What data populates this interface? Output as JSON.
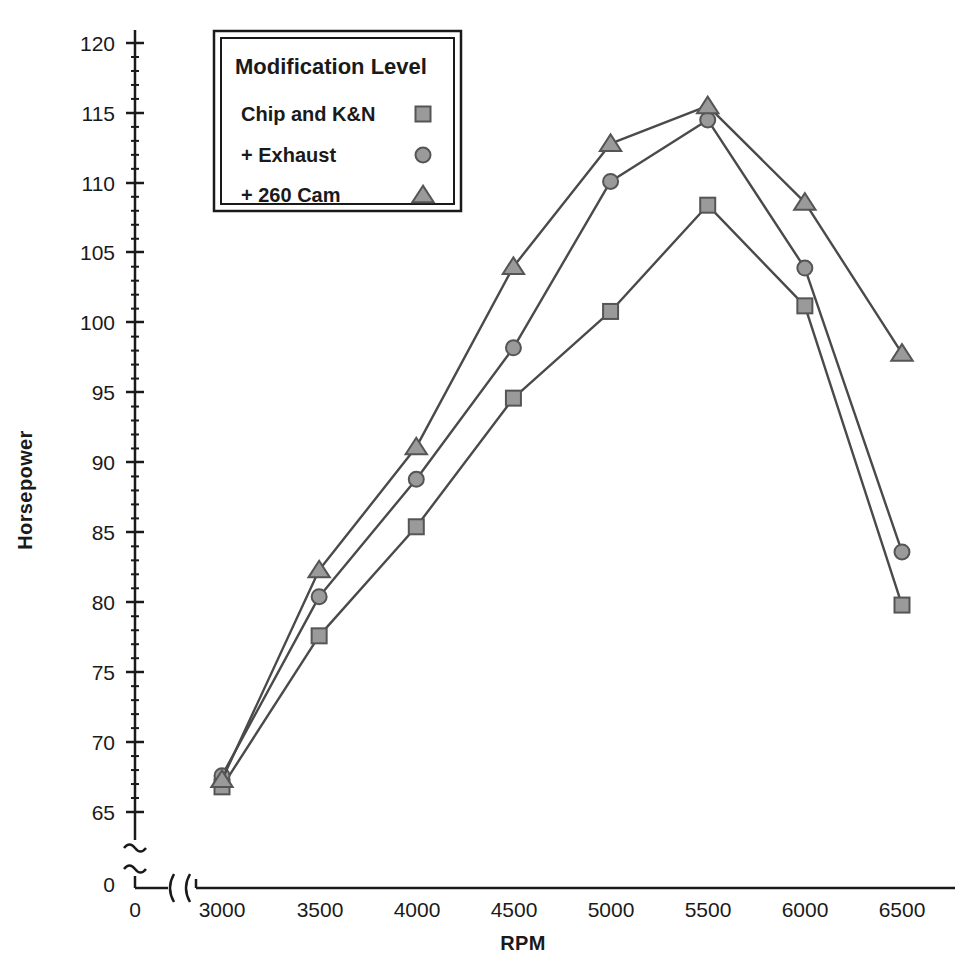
{
  "chart_data": {
    "type": "line",
    "title": "",
    "xlabel": "RPM",
    "ylabel": "Horsepower",
    "x": [
      3000,
      3500,
      4000,
      4500,
      5000,
      5500,
      6000,
      6500
    ],
    "xticklabels": [
      "0",
      "3000",
      "3500",
      "4000",
      "4500",
      "5000",
      "5500",
      "6000",
      "6500"
    ],
    "yticklabels": [
      "0",
      "65",
      "70",
      "75",
      "80",
      "85",
      "90",
      "95",
      "100",
      "105",
      "110",
      "115",
      "120"
    ],
    "xlim": [
      3000,
      6500
    ],
    "ylim": [
      65,
      120
    ],
    "grid": false,
    "axis_break_x": true,
    "axis_break_y": true,
    "legend_position": "top-left",
    "legend_title": "Modification Level",
    "series": [
      {
        "name": "Chip and K&N",
        "marker": "square",
        "values": [
          66.8,
          77.6,
          85.4,
          94.6,
          100.8,
          108.4,
          101.2,
          79.8
        ]
      },
      {
        "name": "+ Exhaust",
        "marker": "circle",
        "values": [
          67.6,
          80.4,
          88.8,
          98.2,
          110.1,
          114.5,
          103.9,
          83.6
        ]
      },
      {
        "name": "+ 260 Cam",
        "marker": "triangle",
        "values": [
          67.3,
          82.3,
          91.1,
          104.0,
          112.8,
          115.5,
          108.6,
          97.8
        ]
      }
    ]
  },
  "style": {
    "marker_fill": "#9a9a9a",
    "marker_stroke": "#555555",
    "line_color": "#4a4a4a",
    "axis_color": "#1a1a1a",
    "text_color": "#1a1a1a",
    "background": "#ffffff"
  },
  "legend": {
    "title": "Modification Level",
    "entries": [
      {
        "label": "Chip and K&N",
        "marker": "square"
      },
      {
        "label": "+ Exhaust",
        "marker": "circle"
      },
      {
        "label": "+ 260 Cam",
        "marker": "triangle"
      }
    ]
  },
  "axes": {
    "x_title": "RPM",
    "y_title": "Horsepower",
    "x_ticks": [
      {
        "label": "0",
        "x": 135
      },
      {
        "label": "3000",
        "x": 222
      },
      {
        "label": "3500",
        "x": 320
      },
      {
        "label": "4000",
        "x": 417
      },
      {
        "label": "4500",
        "x": 514
      },
      {
        "label": "5000",
        "x": 611
      },
      {
        "label": "5500",
        "x": 708
      },
      {
        "label": "6000",
        "x": 805
      },
      {
        "label": "6500",
        "x": 902
      }
    ],
    "y_ticks": [
      {
        "label": "120",
        "y": 43
      },
      {
        "label": "115",
        "y": 113
      },
      {
        "label": "110",
        "y": 183
      },
      {
        "label": "105",
        "y": 252
      },
      {
        "label": "100",
        "y": 322
      },
      {
        "label": "95",
        "y": 392
      },
      {
        "label": "90",
        "y": 462
      },
      {
        "label": "85",
        "y": 532
      },
      {
        "label": "80",
        "y": 602
      },
      {
        "label": "75",
        "y": 672
      },
      {
        "label": "70",
        "y": 742
      },
      {
        "label": "65",
        "y": 812
      },
      {
        "label": "0",
        "y": 884
      }
    ]
  }
}
